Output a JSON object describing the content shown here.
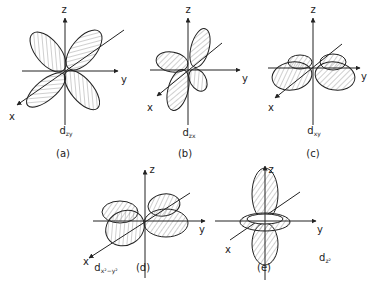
{
  "figure": {
    "panels": [
      {
        "id": "a",
        "caption": "(a)",
        "orbital_main": "d",
        "orbital_sub": "zy",
        "axes": {
          "z": "z",
          "y": "y",
          "x": "x"
        }
      },
      {
        "id": "b",
        "caption": "(b)",
        "orbital_main": "d",
        "orbital_sub": "zx",
        "axes": {
          "z": "z",
          "y": "y",
          "x": "x"
        }
      },
      {
        "id": "c",
        "caption": "(c)",
        "orbital_main": "d",
        "orbital_sub": "xy",
        "axes": {
          "z": "z",
          "y": "y",
          "x": "x"
        }
      },
      {
        "id": "d",
        "caption": "(d)",
        "orbital_main": "d",
        "orbital_sub": "x²−y²",
        "axes": {
          "z": "z",
          "y": "y",
          "x": "x"
        }
      },
      {
        "id": "e",
        "caption": "(e)",
        "orbital_main": "d",
        "orbital_sub": "z²",
        "axes": {
          "z": "z",
          "y": "y",
          "x": "x"
        }
      }
    ]
  },
  "colors": {
    "line": "#222222",
    "hatch": "#777777",
    "background": "#ffffff"
  }
}
